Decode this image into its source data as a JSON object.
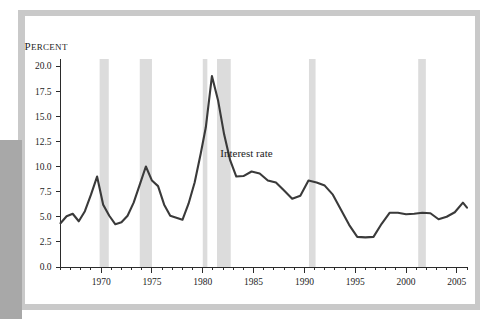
{
  "chart_data": {
    "type": "line",
    "title": "",
    "xlabel": "",
    "ylabel": "Percent",
    "ylabel_display": "PERCENT",
    "xlim": [
      1966,
      2006
    ],
    "ylim": [
      0.0,
      20.0
    ],
    "grid": false,
    "legend_position": "inline-annotation",
    "y_ticks": [
      "0.0",
      "2.5",
      "5.0",
      "7.5",
      "10.0",
      "12.5",
      "15.0",
      "17.5",
      "20.0"
    ],
    "y_tick_values": [
      0.0,
      2.5,
      5.0,
      7.5,
      10.0,
      12.5,
      15.0,
      17.5,
      20.0
    ],
    "x_ticks": [
      "1970",
      "1975",
      "1980",
      "1985",
      "1990",
      "1995",
      "2000",
      "2005"
    ],
    "x_tick_values": [
      1970,
      1975,
      1980,
      1985,
      1990,
      1995,
      2000,
      2005
    ],
    "x_minor_tick_step": 1,
    "annotations": [
      {
        "text": "Interest rate",
        "x": 1984.3,
        "y": 10.9
      }
    ],
    "series": [
      {
        "name": "Interest rate",
        "color": "#3a3a3a",
        "x": [
          1966.0,
          1966.6,
          1967.2,
          1967.8,
          1968.4,
          1969.0,
          1969.6,
          1970.2,
          1970.8,
          1971.4,
          1972.0,
          1972.6,
          1973.2,
          1973.8,
          1974.4,
          1975.0,
          1975.6,
          1976.2,
          1976.8,
          1977.4,
          1978.0,
          1978.6,
          1979.2,
          1979.8,
          1980.3,
          1980.9,
          1981.5,
          1982.1,
          1982.7,
          1983.3,
          1984.0,
          1984.8,
          1985.6,
          1986.4,
          1987.2,
          1988.0,
          1988.8,
          1989.6,
          1990.4,
          1991.2,
          1992.0,
          1992.8,
          1993.6,
          1994.4,
          1995.2,
          1996.0,
          1996.8,
          1997.6,
          1998.4,
          1999.2,
          2000.0,
          2000.8,
          2001.6,
          2002.4,
          2003.2,
          2004.0,
          2004.8,
          2005.6,
          2006.0
        ],
        "y": [
          4.35,
          5.05,
          5.3,
          4.55,
          5.55,
          7.2,
          9.0,
          6.2,
          5.1,
          4.25,
          4.45,
          5.1,
          6.4,
          8.2,
          10.0,
          8.6,
          8.05,
          6.2,
          5.1,
          4.9,
          4.7,
          6.3,
          8.4,
          11.3,
          13.9,
          19.0,
          16.6,
          13.2,
          10.6,
          9.0,
          9.05,
          9.5,
          9.3,
          8.6,
          8.4,
          7.6,
          6.8,
          7.1,
          8.6,
          8.4,
          8.1,
          7.2,
          5.7,
          4.2,
          3.0,
          2.95,
          3.0,
          4.3,
          5.4,
          5.4,
          5.25,
          5.3,
          5.4,
          5.35,
          4.75,
          5.0,
          5.45,
          6.4,
          5.9
        ],
        "y_dense_note": "series sampled at the polyline vertices visible in the plot"
      }
    ],
    "recession_bands": [
      {
        "start": 1969.85,
        "end": 1970.75,
        "label": "recession-band-1970"
      },
      {
        "start": 1973.8,
        "end": 1975.0,
        "label": "recession-band-1974"
      },
      {
        "start": 1980.0,
        "end": 1980.45,
        "label": "recession-band-1980"
      },
      {
        "start": 1981.4,
        "end": 1982.75,
        "label": "recession-band-1982"
      },
      {
        "start": 1990.45,
        "end": 1991.1,
        "label": "recession-band-1990"
      },
      {
        "start": 2001.2,
        "end": 2001.95,
        "label": "recession-band-2001"
      }
    ],
    "colors": {
      "line": "#3a3a3a",
      "recession_band": "#dcdcdc",
      "axis": "#2b2b2b",
      "plot_background": "#ffffff",
      "frame_mat": "#c9c9c9",
      "frame_shadow": "#a8a8a8"
    }
  }
}
